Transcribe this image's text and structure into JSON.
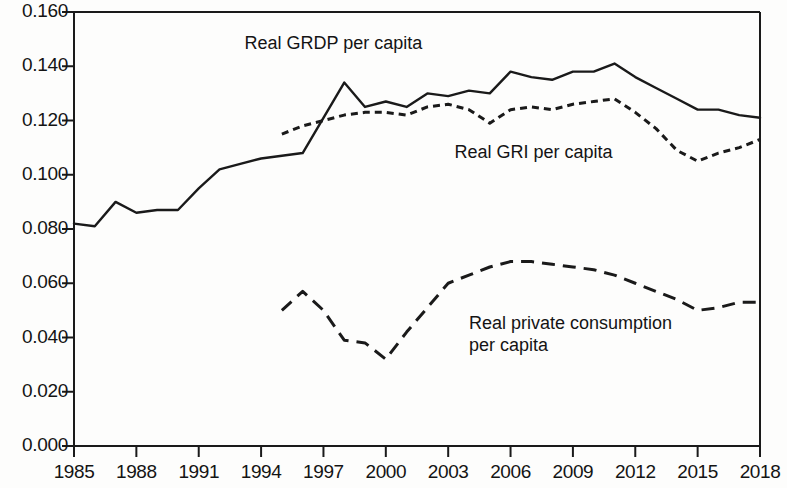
{
  "chart_data": {
    "type": "line",
    "title": "",
    "subtitle": "",
    "xlabel": "",
    "ylabel": "",
    "xlim": [
      1985,
      2018
    ],
    "ylim": [
      0.0,
      0.16
    ],
    "grid": false,
    "legend_position": "inline-annotations",
    "x_ticks": [
      1985,
      1988,
      1991,
      1994,
      1997,
      2000,
      2003,
      2006,
      2009,
      2012,
      2015,
      2018
    ],
    "x_tick_labels": [
      "1985",
      "1988",
      "1991",
      "1994",
      "1997",
      "2000",
      "2003",
      "2006",
      "2009",
      "2012",
      "2015",
      "2018"
    ],
    "y_ticks": [
      0.0,
      0.02,
      0.04,
      0.06,
      0.08,
      0.1,
      0.12,
      0.14,
      0.16
    ],
    "y_tick_labels": [
      "0.000",
      "0.020",
      "0.040",
      "0.060",
      "0.080",
      "0.100",
      "0.120",
      "0.140",
      "0.160"
    ],
    "series": [
      {
        "name": "Real GRDP per capita",
        "style": "solid",
        "color": "#1a1a1a",
        "x": [
          1985,
          1986,
          1987,
          1988,
          1989,
          1990,
          1991,
          1992,
          1993,
          1994,
          1995,
          1996,
          1997,
          1998,
          1999,
          2000,
          2001,
          2002,
          2003,
          2004,
          2005,
          2006,
          2007,
          2008,
          2009,
          2010,
          2011,
          2012,
          2013,
          2014,
          2015,
          2016,
          2017,
          2018
        ],
        "values": [
          0.082,
          0.081,
          0.09,
          0.086,
          0.087,
          0.087,
          0.095,
          0.102,
          0.104,
          0.106,
          0.107,
          0.108,
          0.121,
          0.134,
          0.125,
          0.127,
          0.125,
          0.13,
          0.129,
          0.131,
          0.13,
          0.138,
          0.136,
          0.135,
          0.138,
          0.138,
          0.141,
          0.136,
          0.132,
          0.128,
          0.124,
          0.124,
          0.122,
          0.121
        ]
      },
      {
        "name": "Real GRI per capita",
        "style": "dotted",
        "color": "#1a1a1a",
        "x": [
          1995,
          1996,
          1997,
          1998,
          1999,
          2000,
          2001,
          2002,
          2003,
          2004,
          2005,
          2006,
          2007,
          2008,
          2009,
          2010,
          2011,
          2012,
          2013,
          2014,
          2015,
          2016,
          2017,
          2018
        ],
        "values": [
          0.115,
          0.118,
          0.12,
          0.122,
          0.123,
          0.123,
          0.122,
          0.125,
          0.126,
          0.124,
          0.119,
          0.124,
          0.125,
          0.124,
          0.126,
          0.127,
          0.128,
          0.123,
          0.117,
          0.109,
          0.105,
          0.108,
          0.11,
          0.113
        ]
      },
      {
        "name": "Real private consumption per capita",
        "style": "dashed",
        "color": "#1a1a1a",
        "x": [
          1995,
          1996,
          1997,
          1998,
          1999,
          2000,
          2001,
          2002,
          2003,
          2004,
          2005,
          2006,
          2007,
          2008,
          2009,
          2010,
          2011,
          2012,
          2013,
          2014,
          2015,
          2016,
          2017,
          2018
        ],
        "values": [
          0.05,
          0.057,
          0.05,
          0.039,
          0.038,
          0.032,
          0.042,
          0.051,
          0.06,
          0.063,
          0.066,
          0.068,
          0.068,
          0.067,
          0.066,
          0.065,
          0.063,
          0.06,
          0.057,
          0.054,
          0.05,
          0.051,
          0.053,
          0.053
        ]
      }
    ],
    "annotations": [
      {
        "text": "Real GRDP per capita",
        "x": 1993.2,
        "y": 0.1485,
        "lines": [
          "Real GRDP per capita"
        ]
      },
      {
        "text": "Real GRI per capita",
        "x": 2003.3,
        "y": 0.1085,
        "lines": [
          "Real GRI per capita"
        ]
      },
      {
        "text": "Real private consumption per capita",
        "x": 2004.0,
        "y": 0.0455,
        "lines": [
          "Real private consumption",
          "per capita"
        ]
      }
    ]
  }
}
